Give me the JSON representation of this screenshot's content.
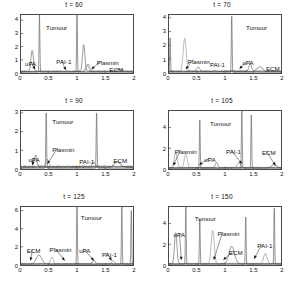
{
  "figure": {
    "title": "",
    "rows": 3,
    "cols": 2,
    "xlabel": "",
    "ylabel": ""
  },
  "chart_data": [
    {
      "type": "line",
      "title": "t = 60",
      "xlabel": "",
      "ylabel": "",
      "xlim": [
        0,
        2
      ],
      "ylim": [
        0,
        4.4
      ],
      "xticks": [
        0,
        0.5,
        1,
        1.5,
        2
      ],
      "xticklabels": [
        "0",
        "0.5",
        "1",
        "1.5",
        "2"
      ],
      "yticks": [
        0,
        1,
        2,
        3,
        4
      ],
      "yticklabels": [
        "0",
        "1",
        "2",
        "3",
        "4"
      ],
      "grid": false,
      "legend": "none",
      "annotations": [
        {
          "text": "uPA",
          "x": 0.07,
          "y": 1.05,
          "arrow_to": {
            "x": 0.25,
            "y": 0.28
          }
        },
        {
          "text": "Tumour",
          "x": 0.44,
          "y": 3.7,
          "arrow_to": null
        },
        {
          "text": "PAI-1",
          "x": 0.62,
          "y": 1.15,
          "arrow_to": {
            "x": 0.8,
            "y": 0.22
          }
        },
        {
          "text": "Plasmin",
          "x": 1.33,
          "y": 1.1,
          "arrow_to": {
            "x": 1.26,
            "y": 0.3
          }
        },
        {
          "text": "ECM",
          "x": 1.55,
          "y": 0.62,
          "arrow_to": null
        }
      ],
      "series": [
        {
          "name": "Tumour",
          "peaks": [
            {
              "x": 0.33,
              "y": 4.4
            },
            {
              "x": 1.0,
              "y": 4.4
            }
          ]
        },
        {
          "name": "uPA",
          "peaks": [
            {
              "x": 0.2,
              "y": 1.6
            },
            {
              "x": 1.12,
              "y": 2.0
            }
          ]
        },
        {
          "name": "PAI-1",
          "peaks": [
            {
              "x": 1.2,
              "y": 0.55
            }
          ]
        },
        {
          "name": "Plasmin",
          "peaks": [
            {
              "x": 1.18,
              "y": 0.5
            }
          ]
        },
        {
          "name": "ECM",
          "peaks": [
            {
              "x": 1.75,
              "y": 0.2
            }
          ]
        }
      ]
    },
    {
      "type": "line",
      "title": "t = 70",
      "xlabel": "",
      "ylabel": "",
      "xlim": [
        0,
        2
      ],
      "ylim": [
        0,
        4.2
      ],
      "xticks": [
        0,
        0.5,
        1,
        1.5,
        2
      ],
      "xticklabels": [
        "0",
        "0.5",
        "1",
        "1.5",
        "2"
      ],
      "yticks": [
        0,
        1,
        2,
        3,
        4
      ],
      "yticklabels": [
        "0",
        "1",
        "2",
        "3",
        "4"
      ],
      "grid": false,
      "legend": "none",
      "annotations": [
        {
          "text": "Plasmin",
          "x": 0.33,
          "y": 1.15,
          "arrow_to": {
            "x": 0.3,
            "y": 0.28
          }
        },
        {
          "text": "PAI-1",
          "x": 0.72,
          "y": 0.92,
          "arrow_to": null
        },
        {
          "text": "Tumour",
          "x": 1.35,
          "y": 3.5,
          "arrow_to": null
        },
        {
          "text": "uPA",
          "x": 1.29,
          "y": 1.05,
          "arrow_to": {
            "x": 1.26,
            "y": 0.3
          }
        },
        {
          "text": "ECM",
          "x": 1.7,
          "y": 0.62,
          "arrow_to": null
        }
      ],
      "series": [
        {
          "name": "Tumour",
          "peaks": [
            {
              "x": 1.12,
              "y": 4.2
            },
            {
              "x": 0.02,
              "y": 2.6
            }
          ]
        },
        {
          "name": "Plasmin",
          "peaks": [
            {
              "x": 0.28,
              "y": 2.4
            }
          ]
        },
        {
          "name": "uPA",
          "peaks": [
            {
              "x": 1.45,
              "y": 0.55
            }
          ]
        },
        {
          "name": "PAI-1",
          "peaks": [
            {
              "x": 0.52,
              "y": 0.3
            }
          ]
        },
        {
          "name": "ECM",
          "peaks": [
            {
              "x": 1.62,
              "y": 0.35
            }
          ]
        }
      ]
    },
    {
      "type": "line",
      "title": "t = 90",
      "xlabel": "",
      "ylabel": "",
      "xlim": [
        0,
        2
      ],
      "ylim": [
        0,
        3.1
      ],
      "xticks": [
        0,
        0.5,
        1,
        1.5,
        2
      ],
      "xticklabels": [
        "0",
        "0.5",
        "1",
        "1.5",
        "2"
      ],
      "yticks": [
        0,
        1,
        2,
        3
      ],
      "yticklabels": [
        "0",
        "1",
        "2",
        "3"
      ],
      "grid": false,
      "legend": "none",
      "annotations": [
        {
          "text": "Tumour",
          "x": 0.55,
          "y": 2.7,
          "arrow_to": null
        },
        {
          "text": "Plasmin",
          "x": 0.55,
          "y": 1.25,
          "arrow_to": {
            "x": 0.47,
            "y": 0.28
          }
        },
        {
          "text": "uPA",
          "x": 0.13,
          "y": 0.72,
          "arrow_to": {
            "x": 0.2,
            "y": 0.22
          }
        },
        {
          "text": "PAI-1",
          "x": 1.02,
          "y": 0.62,
          "arrow_to": null
        },
        {
          "text": "ECM",
          "x": 1.62,
          "y": 0.65,
          "arrow_to": null
        }
      ],
      "series": [
        {
          "name": "Tumour",
          "peaks": [
            {
              "x": 0.45,
              "y": 3.1
            },
            {
              "x": 1.35,
              "y": 3.1
            }
          ]
        },
        {
          "name": "uPA",
          "peaks": [
            {
              "x": 0.26,
              "y": 0.62
            }
          ]
        },
        {
          "name": "Plasmin",
          "peaks": [
            {
              "x": 0.47,
              "y": 0.4
            }
          ]
        },
        {
          "name": "PAI-1",
          "peaks": [
            {
              "x": 1.3,
              "y": 0.28
            }
          ]
        },
        {
          "name": "ECM",
          "peaks": [
            {
              "x": 1.72,
              "y": 0.3
            }
          ]
        }
      ]
    },
    {
      "type": "line",
      "title": "t = 105",
      "xlabel": "",
      "ylabel": "",
      "xlim": [
        0,
        2
      ],
      "ylim": [
        0,
        5.6
      ],
      "xticks": [
        0,
        0.5,
        1,
        1.5,
        2
      ],
      "xticklabels": [
        "0",
        "0.5",
        "1",
        "1.5",
        "2"
      ],
      "yticks": [
        0,
        2,
        4
      ],
      "yticklabels": [
        "0",
        "2",
        "4"
      ],
      "grid": false,
      "legend": "none",
      "annotations": [
        {
          "text": "Plasmin",
          "x": 0.1,
          "y": 2.1,
          "arrow_to": {
            "x": 0.08,
            "y": 0.35
          }
        },
        {
          "text": "Tumour",
          "x": 0.72,
          "y": 4.7,
          "arrow_to": null
        },
        {
          "text": "uPA",
          "x": 0.62,
          "y": 1.3,
          "arrow_to": {
            "x": 0.54,
            "y": 0.4
          }
        },
        {
          "text": "PAI-1",
          "x": 1.0,
          "y": 2.1,
          "arrow_to": {
            "x": 1.3,
            "y": 0.5
          }
        },
        {
          "text": "ECM",
          "x": 1.63,
          "y": 2.0,
          "arrow_to": {
            "x": 1.9,
            "y": 0.35
          }
        }
      ],
      "series": [
        {
          "name": "Tumour",
          "peaks": [
            {
              "x": 0.55,
              "y": 4.9
            },
            {
              "x": 1.3,
              "y": 5.6
            },
            {
              "x": 1.47,
              "y": 5.2
            }
          ]
        },
        {
          "name": "Plasmin",
          "peaks": [
            {
              "x": 0.12,
              "y": 1.5
            },
            {
              "x": 0.3,
              "y": 1.3
            }
          ]
        },
        {
          "name": "uPA",
          "peaks": [
            {
              "x": 0.85,
              "y": 0.5
            }
          ]
        },
        {
          "name": "PAI-1",
          "peaks": [
            {
              "x": 1.25,
              "y": 0.5
            }
          ]
        },
        {
          "name": "ECM",
          "peaks": [
            {
              "x": 1.88,
              "y": 0.3
            }
          ]
        }
      ]
    },
    {
      "type": "line",
      "title": "t = 125",
      "xlabel": "",
      "ylabel": "",
      "xlim": [
        0,
        2
      ],
      "ylim": [
        0,
        6.4
      ],
      "xticks": [
        0,
        0.5,
        1,
        1.5,
        2
      ],
      "xticklabels": [
        "0",
        "0.5",
        "1",
        "1.5",
        "2"
      ],
      "yticks": [
        0,
        2,
        4,
        6
      ],
      "yticklabels": [
        "0",
        "2",
        "4",
        "6"
      ],
      "grid": false,
      "legend": "none",
      "annotations": [
        {
          "text": "ECM",
          "x": 0.1,
          "y": 2.0,
          "arrow_to": {
            "x": 0.17,
            "y": 0.5
          }
        },
        {
          "text": "Plasmin",
          "x": 0.5,
          "y": 2.1,
          "arrow_to": {
            "x": 0.78,
            "y": 0.5
          }
        },
        {
          "text": "Tumour",
          "x": 1.05,
          "y": 5.5,
          "arrow_to": null
        },
        {
          "text": "uPA",
          "x": 1.02,
          "y": 2.0,
          "arrow_to": {
            "x": 1.3,
            "y": 0.5
          }
        },
        {
          "text": "PAI-1",
          "x": 1.42,
          "y": 1.6,
          "arrow_to": {
            "x": 1.62,
            "y": 0.5
          }
        }
      ],
      "series": [
        {
          "name": "Tumour",
          "peaks": [
            {
              "x": 1.0,
              "y": 6.4
            },
            {
              "x": 1.8,
              "y": 6.4
            },
            {
              "x": 1.97,
              "y": 6.0
            }
          ]
        },
        {
          "name": "ECM",
          "peaks": [
            {
              "x": 0.32,
              "y": 1.0
            }
          ]
        },
        {
          "name": "Plasmin",
          "peaks": [
            {
              "x": 0.55,
              "y": 0.75
            }
          ]
        },
        {
          "name": "uPA",
          "peaks": [
            {
              "x": 1.3,
              "y": 0.4
            }
          ]
        },
        {
          "name": "PAI-1",
          "peaks": [
            {
              "x": 1.65,
              "y": 0.35
            }
          ]
        }
      ]
    },
    {
      "type": "line",
      "title": "t = 150",
      "xlabel": "",
      "ylabel": "",
      "xlim": [
        0,
        2
      ],
      "ylim": [
        0,
        5.6
      ],
      "xticks": [
        0,
        0.5,
        1,
        1.5,
        2
      ],
      "xticklabels": [
        "0",
        "0.5",
        "1",
        "1.5",
        "2"
      ],
      "yticks": [
        0,
        2,
        4
      ],
      "yticklabels": [
        "0",
        "2",
        "4"
      ],
      "grid": false,
      "legend": "none",
      "annotations": [
        {
          "text": "uPA",
          "x": 0.08,
          "y": 3.3,
          "arrow_to": {
            "x": 0.22,
            "y": 0.5
          }
        },
        {
          "text": "Tumour",
          "x": 0.45,
          "y": 4.8,
          "arrow_to": null
        },
        {
          "text": "Plasmin",
          "x": 0.85,
          "y": 3.4,
          "arrow_to": {
            "x": 0.8,
            "y": 0.5
          }
        },
        {
          "text": "ECM",
          "x": 1.05,
          "y": 1.6,
          "arrow_to": {
            "x": 0.97,
            "y": 0.5
          }
        },
        {
          "text": "PAI-1",
          "x": 1.55,
          "y": 2.2,
          "arrow_to": {
            "x": 1.52,
            "y": 0.6
          }
        }
      ],
      "series": [
        {
          "name": "Tumour",
          "peaks": [
            {
              "x": 0.3,
              "y": 5.6
            },
            {
              "x": 0.55,
              "y": 4.6
            },
            {
              "x": 1.37,
              "y": 4.6
            },
            {
              "x": 1.88,
              "y": 5.6
            }
          ]
        },
        {
          "name": "uPA",
          "peaks": [
            {
              "x": 0.12,
              "y": 3.0
            }
          ]
        },
        {
          "name": "Plasmin",
          "peaks": [
            {
              "x": 0.78,
              "y": 3.2
            }
          ]
        },
        {
          "name": "ECM",
          "peaks": [
            {
              "x": 1.12,
              "y": 1.7
            }
          ]
        },
        {
          "name": "PAI-1",
          "peaks": [
            {
              "x": 1.72,
              "y": 1.0
            }
          ]
        }
      ]
    }
  ]
}
